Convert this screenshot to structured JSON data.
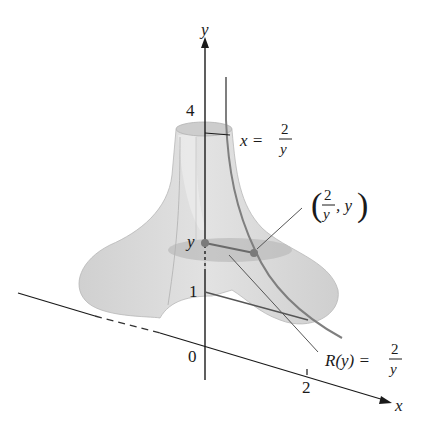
{
  "diagram": {
    "type": "solid-of-revolution",
    "colors": {
      "surface": "#d6d6d6",
      "surface_dark": "#bdbdbd",
      "curve": "#808080",
      "axis": "#1a1a1a",
      "point": "#7a7a7a"
    },
    "axes": {
      "y_label": "y",
      "x_label": "x",
      "y_ticks": [
        {
          "label": "4",
          "value": 4
        },
        {
          "label": "1",
          "value": 1
        },
        {
          "label": "y",
          "value": "y"
        }
      ],
      "origin_label": "0",
      "x_ticks": [
        {
          "label": "2",
          "value": 2
        }
      ]
    },
    "annotations": {
      "curve_eq_lhs": "x =",
      "curve_eq_num": "2",
      "curve_eq_den": "y",
      "point_open": "(",
      "point_num": "2",
      "point_den": "y",
      "point_rest": ", y",
      "point_close": ")",
      "radius_lhs": "R(y) =",
      "radius_num": "2",
      "radius_den": "y"
    }
  }
}
